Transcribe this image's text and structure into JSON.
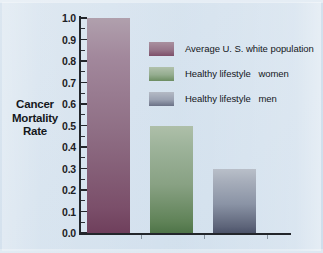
{
  "chart_data": {
    "type": "bar",
    "title": "",
    "xlabel": "",
    "ylabel": "Cancer Mortality Rate",
    "ylabel_lines": [
      "Cancer",
      "Mortality",
      "Rate"
    ],
    "categories": [
      "Average U. S. white population",
      "Healthy lifestyle   women",
      "Healthy lifestyle   men"
    ],
    "values": [
      1.0,
      0.5,
      0.3
    ],
    "ylim": [
      0.0,
      1.0
    ],
    "ytick_labels": [
      "1.0",
      "0.9",
      "0.8",
      "0.7",
      "0.6",
      "0.5",
      "0.4",
      "0.3",
      "0.2",
      "0.1",
      "0.0"
    ],
    "ytick_values": [
      1.0,
      0.9,
      0.8,
      0.7,
      0.6,
      0.5,
      0.4,
      0.3,
      0.2,
      0.1,
      0.0
    ],
    "minor_tick_step": 0.05,
    "grid": false,
    "legend_position": "upper-right-inside",
    "colors": [
      "#7d4f69",
      "#6c8d62",
      "#6a7186"
    ],
    "background_color": "#d8e4ef",
    "axis_color": "#23262b"
  },
  "legend": {
    "entries": [
      {
        "label": "Average U. S. white population",
        "color": "#7d4f69"
      },
      {
        "label": "Healthy lifestyle   women",
        "color": "#6c8d62"
      },
      {
        "label": "Healthy lifestyle   men",
        "color": "#6a7186"
      }
    ]
  },
  "axis": {
    "y_title_line1": "Cancer",
    "y_title_line2": "Mortality",
    "y_title_line3": "Rate",
    "ticks": [
      {
        "label": "1.0"
      },
      {
        "label": "0.9"
      },
      {
        "label": "0.8"
      },
      {
        "label": "0.7"
      },
      {
        "label": "0.6"
      },
      {
        "label": "0.5"
      },
      {
        "label": "0.4"
      },
      {
        "label": "0.3"
      },
      {
        "label": "0.2"
      },
      {
        "label": "0.1"
      },
      {
        "label": "0.0"
      }
    ]
  }
}
